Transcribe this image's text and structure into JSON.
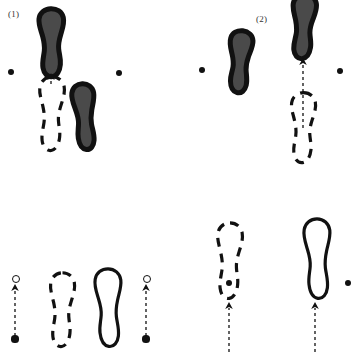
{
  "figure": {
    "panels": [
      {
        "id": "panel-1",
        "label": "(1)",
        "label_x": 8,
        "label_y": 9
      },
      {
        "id": "panel-2",
        "label": "(2)",
        "label_x": 256,
        "label_y": 14
      },
      {
        "id": "panel-3",
        "label": "",
        "label_x": 8,
        "label_y": 190
      },
      {
        "id": "panel-4",
        "label": "",
        "label_x": 256,
        "label_y": 190
      }
    ]
  },
  "colors": {
    "ink": "#111111",
    "fill_dark": "#4a4a4a",
    "stroke": "#111111",
    "background": "#ffffff",
    "label": "#333333"
  },
  "footprints": [
    {
      "name": "foot-dark-panel1-upper",
      "panel": "panel-1",
      "style": "filled",
      "x": 33,
      "y": 8,
      "w": 38,
      "h": 70,
      "flip": false,
      "rotate": -2
    },
    {
      "name": "foot-dashed-panel1-lower-left",
      "panel": "panel-1",
      "style": "dashed",
      "x": 33,
      "y": 76,
      "w": 38,
      "h": 76,
      "flip": false,
      "rotate": 0
    },
    {
      "name": "foot-dark-panel1-lower-right",
      "panel": "panel-1",
      "style": "filled",
      "x": 67,
      "y": 83,
      "w": 34,
      "h": 68,
      "flip": true,
      "rotate": 3
    },
    {
      "name": "foot-dark-panel2-left",
      "panel": "panel-2",
      "style": "filled",
      "x": 222,
      "y": 30,
      "w": 35,
      "h": 64,
      "flip": true,
      "rotate": -6
    },
    {
      "name": "foot-dark-panel2-right",
      "panel": "panel-2",
      "style": "filled",
      "x": 286,
      "y": -6,
      "w": 36,
      "h": 66,
      "flip": false,
      "rotate": 2
    },
    {
      "name": "foot-dashed-panel2-lower",
      "panel": "panel-2",
      "style": "dashed",
      "x": 285,
      "y": 92,
      "w": 37,
      "h": 72,
      "flip": false,
      "rotate": 0
    },
    {
      "name": "foot-dashed-panel3-left",
      "panel": "panel-3",
      "style": "dashed",
      "x": 44,
      "y": 272,
      "w": 37,
      "h": 76,
      "flip": false,
      "rotate": 0
    },
    {
      "name": "foot-solid-panel3-right",
      "panel": "panel-3",
      "style": "solid",
      "x": 88,
      "y": 268,
      "w": 40,
      "h": 80,
      "flip": true,
      "rotate": 0
    },
    {
      "name": "foot-dashed-panel4-left",
      "panel": "panel-4",
      "style": "dashed",
      "x": 211,
      "y": 222,
      "w": 38,
      "h": 78,
      "flip": false,
      "rotate": 0
    },
    {
      "name": "foot-solid-panel4-right",
      "panel": "panel-4",
      "style": "solid",
      "x": 297,
      "y": 218,
      "w": 40,
      "h": 82,
      "flip": true,
      "rotate": 0
    }
  ],
  "markers": [
    {
      "name": "dot-panel1-left",
      "panel": "panel-1",
      "type": "filled-dot",
      "x": 11,
      "y": 72,
      "r": 3.4
    },
    {
      "name": "dot-panel1-right",
      "panel": "panel-1",
      "type": "filled-dot",
      "x": 119,
      "y": 73,
      "r": 3.4
    },
    {
      "name": "dot-panel2-left",
      "panel": "panel-2",
      "type": "filled-dot",
      "x": 202,
      "y": 70,
      "r": 3.4
    },
    {
      "name": "dot-panel2-right",
      "panel": "panel-2",
      "type": "filled-dot",
      "x": 340,
      "y": 71,
      "r": 3.4
    },
    {
      "name": "dot-panel3-left-bottom",
      "panel": "panel-3",
      "type": "filled-dot",
      "x": 15,
      "y": 339,
      "r": 3.6
    },
    {
      "name": "ring-panel3-left-top",
      "panel": "panel-3",
      "type": "open-circle",
      "x": 15,
      "y": 278,
      "r": 3.2
    },
    {
      "name": "dot-panel3-right-bottom",
      "panel": "panel-3",
      "type": "filled-dot",
      "x": 146,
      "y": 339,
      "r": 3.6
    },
    {
      "name": "ring-panel3-right-top",
      "panel": "panel-3",
      "type": "open-circle",
      "x": 146,
      "y": 278,
      "r": 3.2
    },
    {
      "name": "dot-panel4-left",
      "panel": "panel-4",
      "type": "filled-dot",
      "x": 229,
      "y": 283,
      "r": 3.4
    },
    {
      "name": "dot-panel4-right",
      "panel": "panel-4",
      "type": "filled-dot",
      "x": 348,
      "y": 283,
      "r": 3.4
    }
  ],
  "arrows": [
    {
      "name": "arrow-panel1-step",
      "panel": "panel-1",
      "x": 51,
      "y1": 84,
      "y2": 73,
      "head": true,
      "dashed": true
    },
    {
      "name": "arrow-panel2-step",
      "panel": "panel-2",
      "x": 303,
      "y1": 128,
      "y2": 58,
      "head": true,
      "dashed": true
    },
    {
      "name": "arrow-panel3-left",
      "panel": "panel-3",
      "x": 15,
      "y1": 336,
      "y2": 284,
      "head": true,
      "dashed": true
    },
    {
      "name": "arrow-panel3-right",
      "panel": "panel-3",
      "x": 146,
      "y1": 336,
      "y2": 284,
      "head": true,
      "dashed": true
    },
    {
      "name": "arrow-panel4-left",
      "panel": "panel-4",
      "x": 229,
      "y1": 352,
      "y2": 302,
      "head": true,
      "dashed": true
    },
    {
      "name": "arrow-panel4-right",
      "panel": "panel-4",
      "x": 315,
      "y1": 352,
      "y2": 302,
      "head": true,
      "dashed": true
    }
  ]
}
